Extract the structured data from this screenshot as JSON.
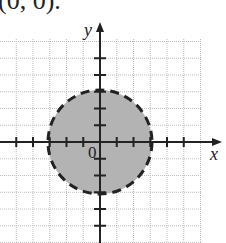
{
  "caption": "(0, 0).",
  "axes": {
    "x_label": "x",
    "y_label": "y",
    "origin_label": "0"
  },
  "chart_data": {
    "type": "diagram",
    "title": "",
    "shape": {
      "kind": "circle",
      "center": [
        0,
        0
      ],
      "radius": 3,
      "boundary": "dashed",
      "fill": "shaded"
    },
    "inequality": "x^2 + y^2 < 9",
    "grid": true,
    "xlim": [
      -6,
      6
    ],
    "ylim": [
      -6,
      6
    ],
    "tick_step": 1
  },
  "colors": {
    "fill": "#b3b3b3",
    "grid": "#bdbdbd",
    "axis": "#222222"
  }
}
